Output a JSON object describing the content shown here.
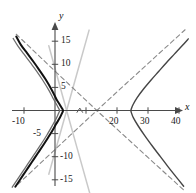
{
  "figure": {
    "background": "#ffffff",
    "width": 196,
    "height": 193,
    "axis_color": "#4a4a4a",
    "x_axis_name": "x",
    "y_axis_name": "y"
  },
  "chart_data": {
    "type": "line",
    "title": "",
    "xlabel": "x",
    "ylabel": "y",
    "xlim": [
      -14,
      47
    ],
    "ylim": [
      -17,
      17
    ],
    "grid": false,
    "legend": "none",
    "x_ticks": [
      -10,
      10,
      20,
      30,
      40
    ],
    "x_tick_labels": [
      "-10",
      "",
      "20",
      "30",
      "40"
    ],
    "y_ticks": [
      15,
      10,
      5,
      -5,
      -10,
      -15
    ],
    "y_tick_labels": [
      "15",
      "10",
      "5",
      "-5",
      "-10",
      "-15"
    ],
    "series": [
      {
        "name": "left-branch-bold",
        "style": "solid",
        "color": "#111111",
        "width": 2.0,
        "description": "left-opening hyperbola branch, vertex near (3,0)",
        "points": [
          [
            -12.5,
            16.0
          ],
          [
            -11.0,
            14.2
          ],
          [
            -9.0,
            12.4
          ],
          [
            -7.0,
            10.6
          ],
          [
            -5.0,
            8.7
          ],
          [
            -3.0,
            6.7
          ],
          [
            -1.0,
            4.4
          ],
          [
            0.5,
            2.4
          ],
          [
            1.6,
            1.2
          ],
          [
            2.4,
            0.3
          ],
          [
            2.6,
            0.0
          ],
          [
            2.4,
            -0.4
          ],
          [
            1.6,
            -1.5
          ],
          [
            0.3,
            -3.0
          ],
          [
            -1.5,
            -5.1
          ],
          [
            -3.5,
            -7.2
          ],
          [
            -5.5,
            -9.2
          ],
          [
            -7.5,
            -11.2
          ],
          [
            -9.5,
            -13.2
          ],
          [
            -11.5,
            -15.2
          ],
          [
            -12.8,
            -16.5
          ]
        ]
      },
      {
        "name": "left-branch-gray",
        "style": "solid",
        "color": "#6e6e6e",
        "width": 1.3,
        "description": "second left-opening hyperbola branch, vertex near (1.5,0)",
        "points": [
          [
            -13.5,
            15.6
          ],
          [
            -12.0,
            14.0
          ],
          [
            -10.0,
            12.2
          ],
          [
            -8.0,
            10.4
          ],
          [
            -6.0,
            8.6
          ],
          [
            -4.0,
            6.6
          ],
          [
            -2.0,
            4.4
          ],
          [
            -0.5,
            2.5
          ],
          [
            0.6,
            1.2
          ],
          [
            1.3,
            0.3
          ],
          [
            1.5,
            0.0
          ],
          [
            1.3,
            -0.4
          ],
          [
            0.5,
            -1.6
          ],
          [
            -0.8,
            -3.2
          ],
          [
            -2.6,
            -5.3
          ],
          [
            -4.6,
            -7.4
          ],
          [
            -6.6,
            -9.4
          ],
          [
            -8.6,
            -11.4
          ],
          [
            -10.6,
            -13.4
          ],
          [
            -12.6,
            -15.4
          ],
          [
            -13.8,
            -16.6
          ]
        ]
      },
      {
        "name": "right-branch",
        "style": "solid",
        "color": "#454545",
        "width": 1.4,
        "description": "right-opening hyperbola branch, vertex near (24.5,0)",
        "points": [
          [
            43.0,
            15.5
          ],
          [
            41.0,
            14.0
          ],
          [
            38.5,
            12.2
          ],
          [
            36.0,
            10.4
          ],
          [
            33.5,
            8.5
          ],
          [
            31.0,
            6.6
          ],
          [
            28.5,
            4.6
          ],
          [
            26.5,
            2.8
          ],
          [
            25.2,
            1.3
          ],
          [
            24.6,
            0.3
          ],
          [
            24.5,
            0.0
          ],
          [
            24.6,
            -0.4
          ],
          [
            25.3,
            -1.6
          ],
          [
            26.8,
            -3.3
          ],
          [
            29.0,
            -5.5
          ],
          [
            31.5,
            -7.8
          ],
          [
            34.0,
            -10.0
          ],
          [
            36.5,
            -12.2
          ],
          [
            39.0,
            -14.3
          ],
          [
            41.5,
            -16.4
          ]
        ]
      }
    ],
    "asymptotes": [
      {
        "name": "steep-asymptote-positive",
        "style": "solid",
        "color": "#c9c9c9",
        "width": 1.5,
        "slope": 2.4,
        "intercept": -9.0,
        "description": "light gray steep line rising to the right",
        "points": [
          [
            -2.0,
            -13.8
          ],
          [
            4.0,
            0.6
          ],
          [
            11.0,
            17.4
          ]
        ]
      },
      {
        "name": "steep-asymptote-negative",
        "style": "solid",
        "color": "#c9c9c9",
        "width": 1.5,
        "slope": -2.4,
        "intercept": 9.0,
        "description": "light gray steep line falling to the right",
        "points": [
          [
            -2.0,
            14.0
          ],
          [
            4.0,
            -0.6
          ],
          [
            11.5,
            -18.6
          ]
        ]
      },
      {
        "name": "shallow-asymptote-positive",
        "style": "dashed",
        "color": "#8a8a8a",
        "width": 1.1,
        "slope": 0.63,
        "intercept": -8.5,
        "description": "gray dashed line rising to the right through lower-left",
        "points": [
          [
            -12.0,
            -16.0
          ],
          [
            13.5,
            0.0
          ],
          [
            42.0,
            17.5
          ]
        ]
      },
      {
        "name": "shallow-asymptote-negative",
        "style": "dashed",
        "color": "#8a8a8a",
        "width": 1.1,
        "slope": -0.63,
        "intercept": 8.5,
        "description": "gray dashed line falling to the right through upper-left",
        "points": [
          [
            -12.5,
            16.5
          ],
          [
            13.5,
            0.0
          ],
          [
            42.0,
            -17.5
          ]
        ]
      }
    ],
    "markers": [
      {
        "name": "intersection-caret",
        "symbol": "^",
        "x": 8.0,
        "y": 0.0,
        "color": "#555555"
      }
    ]
  }
}
